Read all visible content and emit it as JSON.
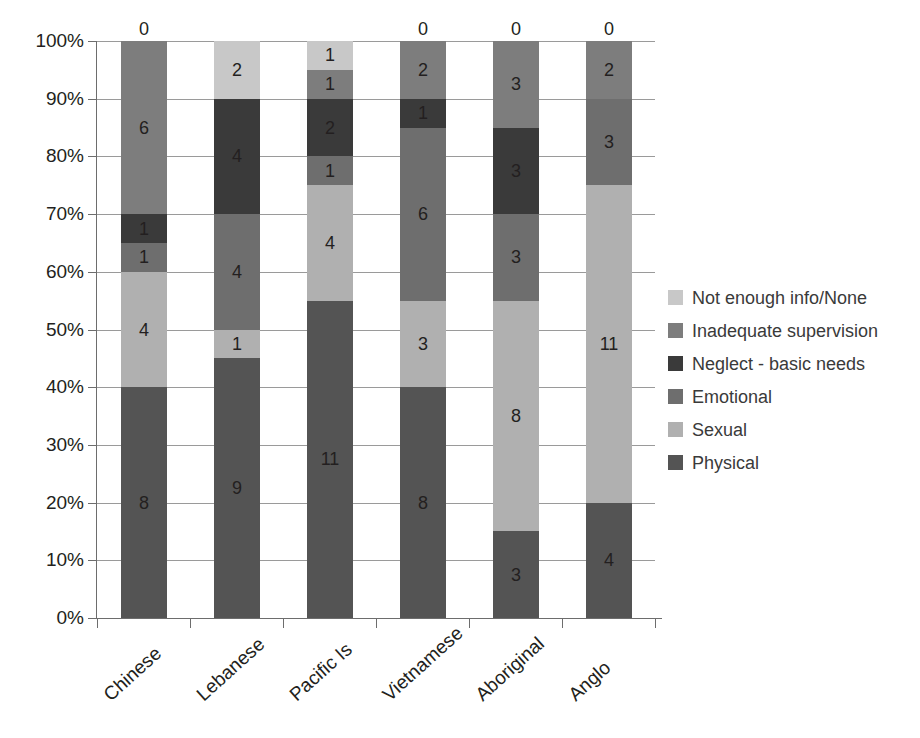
{
  "chart_data": {
    "type": "bar",
    "subtype": "stacked-100-percent",
    "title": "",
    "xlabel": "",
    "ylabel": "",
    "ylim": [
      0,
      100
    ],
    "ytick_labels": [
      "0%",
      "10%",
      "20%",
      "30%",
      "40%",
      "50%",
      "60%",
      "70%",
      "80%",
      "90%",
      "100%"
    ],
    "ytick_values": [
      0,
      10,
      20,
      30,
      40,
      50,
      60,
      70,
      80,
      90,
      100
    ],
    "grid": true,
    "legend_position": "right",
    "categories": [
      "Chinese",
      "Lebanese",
      "Pacific Is",
      "Vietnamese",
      "Aboriginal",
      "Anglo"
    ],
    "stack_order_bottom_to_top": [
      "Physical",
      "Sexual",
      "Emotional",
      "Neglect - basic needs",
      "Inadequate supervision",
      "Not enough info/None"
    ],
    "series": [
      {
        "name": "Physical",
        "color": "#545454",
        "values": [
          8,
          9,
          11,
          8,
          3,
          4
        ]
      },
      {
        "name": "Sexual",
        "color": "#b0b0b0",
        "values": [
          4,
          1,
          4,
          3,
          8,
          11
        ]
      },
      {
        "name": "Emotional",
        "color": "#6e6e6e",
        "values": [
          1,
          4,
          1,
          6,
          3,
          3
        ]
      },
      {
        "name": "Neglect - basic needs",
        "color": "#3a3a3a",
        "values": [
          1,
          4,
          2,
          1,
          3,
          0
        ]
      },
      {
        "name": "Inadequate supervision",
        "color": "#7d7d7d",
        "values": [
          6,
          0,
          1,
          2,
          3,
          2
        ]
      },
      {
        "name": "Not enough info/None",
        "color": "#c8c8c8",
        "values": [
          0,
          2,
          1,
          0,
          0,
          0
        ]
      }
    ],
    "totals": [
      20,
      20,
      20,
      20,
      20,
      20
    ],
    "data_labels_shown": true
  },
  "legend": {
    "entries": [
      {
        "label": "Not enough info/None",
        "color": "#c8c8c8"
      },
      {
        "label": "Inadequate supervision",
        "color": "#7d7d7d"
      },
      {
        "label": "Neglect - basic needs",
        "color": "#3a3a3a"
      },
      {
        "label": "Emotional",
        "color": "#6e6e6e"
      },
      {
        "label": "Sexual",
        "color": "#b0b0b0"
      },
      {
        "label": "Physical",
        "color": "#545454"
      }
    ]
  }
}
